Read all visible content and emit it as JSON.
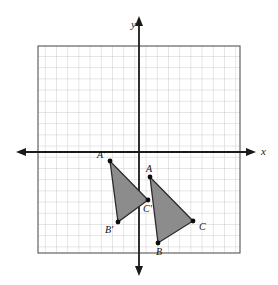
{
  "figure": {
    "background_color": "#ffffff"
  },
  "axes": {
    "x_label": "x",
    "y_label": "y",
    "axis_color": "#1a1a1a",
    "x_axis_y_pixel": 152,
    "y_axis_x_pixel": 139,
    "arrows": [
      "left",
      "right",
      "up",
      "down"
    ]
  },
  "grid": {
    "minor_color": "#b9b9b9",
    "border_color": "#555555",
    "left_px": 38,
    "top_px": 46,
    "right_px": 240,
    "bottom_px": 253,
    "cell_px": 11.2,
    "columns": 18,
    "rows": 19,
    "show_grid": true
  },
  "chart_data": {
    "type": "scatter",
    "title": "",
    "xlabel": "x",
    "ylabel": "y",
    "xlim": [
      -9,
      9
    ],
    "ylim": [
      -9.5,
      9.5
    ],
    "grid": true,
    "legend": "none",
    "unit_px": 11.2,
    "origin_px": {
      "x": 139,
      "y": 152
    },
    "series": [
      {
        "name": "Triangle ABC",
        "fill_color": "#8c8c8c",
        "stroke_color": "#2b2b2b",
        "points": [
          {
            "label": "A",
            "x": 1.0,
            "y": -2.5,
            "px": 150,
            "py": 177,
            "label_dx": -4,
            "label_dy": -5
          },
          {
            "label": "B",
            "x": 1.7,
            "y": -8.5,
            "px": 158,
            "py": 243,
            "label_dx": -2,
            "label_dy": 12
          },
          {
            "label": "C",
            "x": 4.8,
            "y": -6.5,
            "px": 193,
            "py": 221,
            "label_dx": 6,
            "label_dy": 9
          }
        ]
      },
      {
        "name": "Triangle A'B'C'",
        "fill_color": "#8c8c8c",
        "stroke_color": "#2b2b2b",
        "points": [
          {
            "label": "A'",
            "x": -2.6,
            "y": -1.0,
            "px": 110,
            "py": 161,
            "label_dx": -13,
            "label_dy": -3
          },
          {
            "label": "B'",
            "x": -1.9,
            "y": -6.5,
            "px": 118,
            "py": 222,
            "label_dx": -13,
            "label_dy": 11
          },
          {
            "label": "C'",
            "x": 0.8,
            "y": -4.5,
            "px": 148,
            "py": 200,
            "label_dx": -5,
            "label_dy": 12
          }
        ]
      }
    ]
  },
  "labels": {
    "A": "A",
    "B": "B",
    "C": "C",
    "A_prime": "A'",
    "B_prime": "B'",
    "C_prime": "C'",
    "x_axis": "x",
    "y_axis": "y"
  }
}
